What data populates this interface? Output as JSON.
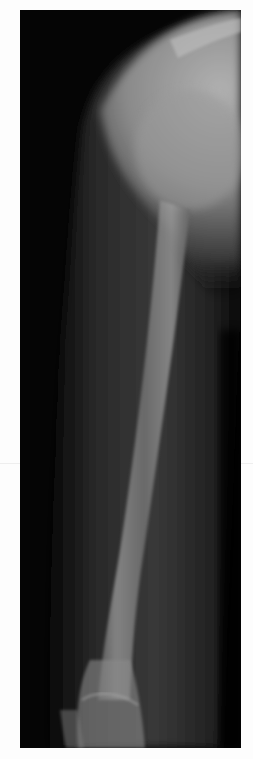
{
  "image": {
    "type": "radiograph",
    "subject": "upper arm x-ray (humerus, shoulder to elbow)",
    "view": "lateral",
    "background_color": "#ffffff",
    "film_color": "#050505",
    "bone_color": "#9a9a9a",
    "soft_tissue_color": "#4a4a4a"
  }
}
